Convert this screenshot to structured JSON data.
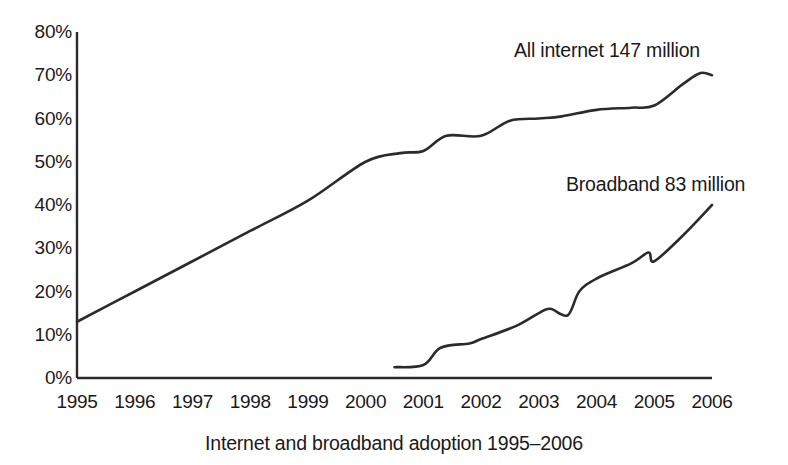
{
  "chart_data": {
    "type": "line",
    "title": "",
    "caption": "Internet and broadband adoption 1995–2006",
    "xlabel": "",
    "ylabel": "",
    "grid": false,
    "legend_position": "inline-annotation",
    "x": [
      1995,
      1996,
      1997,
      1998,
      1999,
      2000,
      2001,
      2002,
      2003,
      2004,
      2005,
      2006
    ],
    "xlim": [
      1995,
      2006
    ],
    "ylim": [
      0,
      80
    ],
    "ytick_labels": [
      "80%",
      "70%",
      "60%",
      "50%",
      "40%",
      "30%",
      "20%",
      "10%",
      "0%"
    ],
    "ytick_values": [
      80,
      70,
      60,
      50,
      40,
      30,
      20,
      10,
      0
    ],
    "xtick_labels": [
      "1995",
      "1996",
      "1997",
      "1998",
      "1999",
      "2000",
      "2001",
      "2002",
      "2003",
      "2004",
      "2005",
      "2006"
    ],
    "series": [
      {
        "name": "All internet",
        "annotation": "All internet 147 million",
        "color": "#2b2b2b",
        "x": [
          1995,
          1996,
          1997,
          1998,
          1999,
          2000,
          2000.6,
          2001,
          2001.4,
          2002,
          2002.5,
          2003,
          2003.4,
          2004,
          2004.6,
          2005,
          2005.5,
          2005.8,
          2006
        ],
        "values": [
          13,
          20,
          27,
          34,
          41,
          50,
          52,
          52.5,
          56,
          56,
          59.5,
          60,
          60.5,
          62,
          62.5,
          63,
          68,
          70.5,
          70
        ]
      },
      {
        "name": "Broadband",
        "annotation": "Broadband 83 million",
        "color": "#2b2b2b",
        "x": [
          2000.5,
          2001,
          2001.3,
          2001.8,
          2002,
          2002.6,
          2003,
          2003.2,
          2003.5,
          2003.7,
          2004,
          2004.6,
          2004.9,
          2005,
          2005.5,
          2006
        ],
        "values": [
          2.5,
          3,
          7,
          8,
          9,
          12,
          15,
          16,
          14.5,
          20,
          23,
          26.5,
          29,
          27,
          33,
          40
        ]
      }
    ]
  },
  "axis": {
    "y_ticks": [
      {
        "label": "80%",
        "value": 80
      },
      {
        "label": "70%",
        "value": 70
      },
      {
        "label": "60%",
        "value": 60
      },
      {
        "label": "50%",
        "value": 50
      },
      {
        "label": "40%",
        "value": 40
      },
      {
        "label": "30%",
        "value": 30
      },
      {
        "label": "20%",
        "value": 20
      },
      {
        "label": "10%",
        "value": 10
      },
      {
        "label": "0%",
        "value": 0
      }
    ],
    "x_ticks": [
      {
        "label": "1995",
        "value": 1995
      },
      {
        "label": "1996",
        "value": 1996
      },
      {
        "label": "1997",
        "value": 1997
      },
      {
        "label": "1998",
        "value": 1998
      },
      {
        "label": "1999",
        "value": 1999
      },
      {
        "label": "2000",
        "value": 2000
      },
      {
        "label": "2001",
        "value": 2001
      },
      {
        "label": "2002",
        "value": 2002
      },
      {
        "label": "2003",
        "value": 2003
      },
      {
        "label": "2004",
        "value": 2004
      },
      {
        "label": "2005",
        "value": 2005
      },
      {
        "label": "2006",
        "value": 2006
      }
    ]
  },
  "annotations": {
    "all_internet": "All internet 147 million",
    "broadband": "Broadband 83 million"
  },
  "caption": "Internet and broadband adoption 1995–2006",
  "colors": {
    "line": "#2b2b2b",
    "axis": "#2b2b2b",
    "text": "#1a1a1a",
    "background": "#ffffff"
  }
}
